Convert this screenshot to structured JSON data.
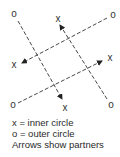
{
  "diagram": {
    "markers": [
      {
        "id": "o-top-left",
        "symbol": "o",
        "x": 14,
        "y": 17
      },
      {
        "id": "x-top",
        "symbol": "x",
        "x": 58,
        "y": 22
      },
      {
        "id": "o-top-right",
        "symbol": "o",
        "x": 113,
        "y": 18
      },
      {
        "id": "x-left",
        "symbol": "x",
        "x": 14,
        "y": 68
      },
      {
        "id": "x-right",
        "symbol": "x",
        "x": 110,
        "y": 61
      },
      {
        "id": "o-bottom-left",
        "symbol": "o",
        "x": 13,
        "y": 108
      },
      {
        "id": "x-bottom",
        "symbol": "x",
        "x": 65,
        "y": 111
      },
      {
        "id": "o-bottom-right",
        "symbol": "o",
        "x": 111,
        "y": 108
      }
    ],
    "arrows": [
      {
        "from": "o-top-left",
        "to": "x-bottom",
        "x1": 18,
        "y1": 21,
        "x2": 62,
        "y2": 99
      },
      {
        "from": "o-top-right",
        "to": "x-left",
        "x1": 107,
        "y1": 18,
        "x2": 22,
        "y2": 63
      },
      {
        "from": "o-bottom-right",
        "to": "x-top",
        "x1": 107,
        "y1": 99,
        "x2": 60,
        "y2": 25
      },
      {
        "from": "o-bottom-left",
        "to": "x-right",
        "x1": 18,
        "y1": 103,
        "x2": 102,
        "y2": 61
      }
    ],
    "line_style": "dashed",
    "line_color": "#333333"
  },
  "legend": {
    "line1": "x  =  inner circle",
    "line2": "o  =  outer circle",
    "line3": "Arrows show partners"
  }
}
